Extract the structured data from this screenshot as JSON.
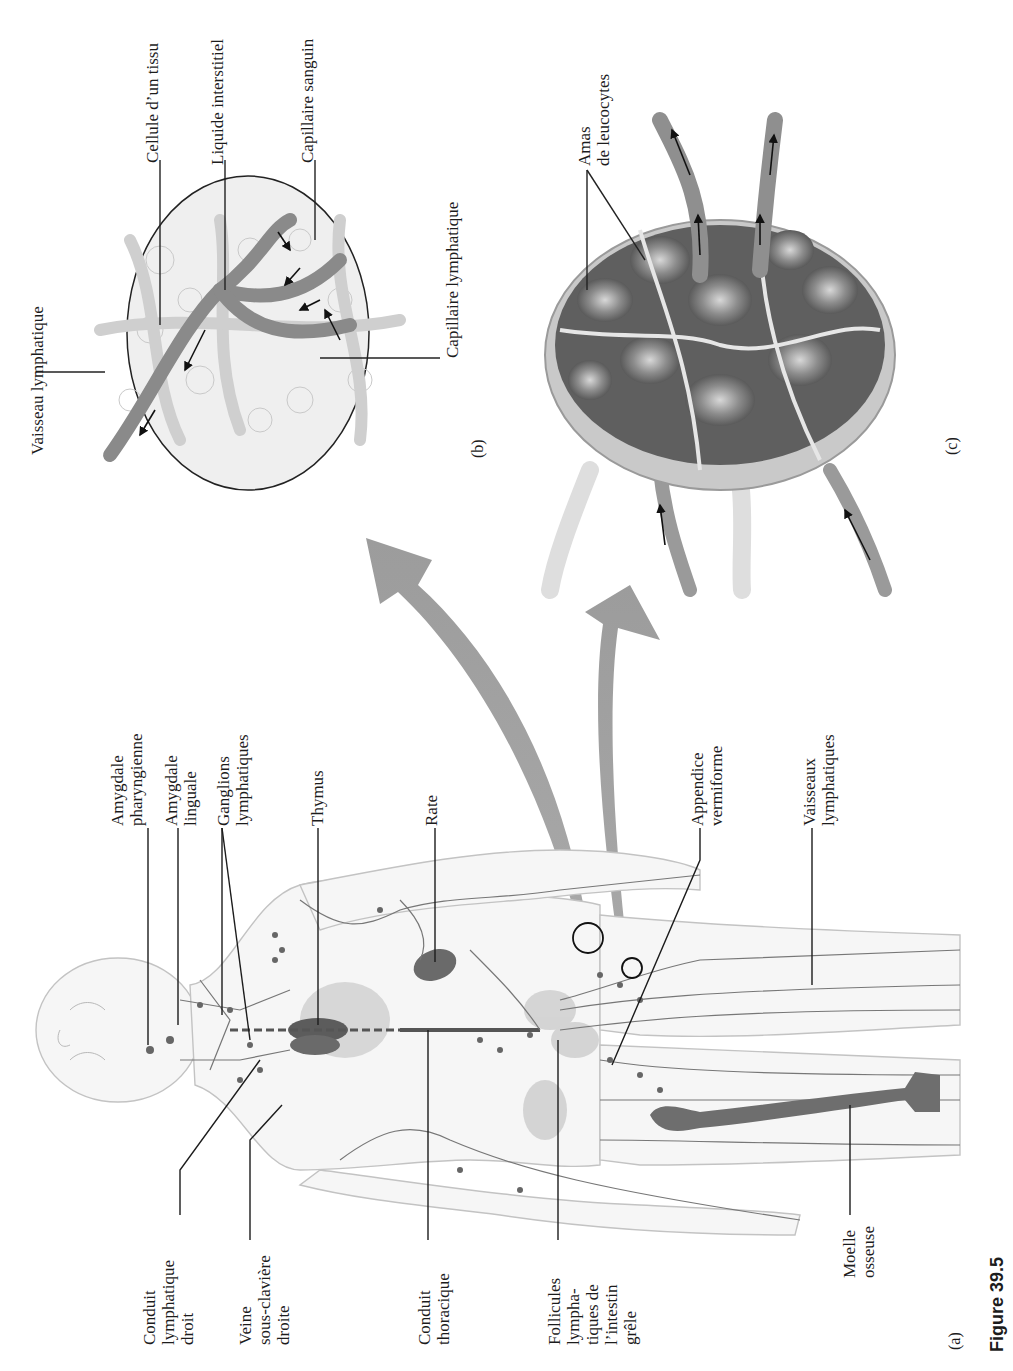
{
  "figure": {
    "caption": "Figure 39.5",
    "orientation": "rotated 90° counter-clockwise",
    "panels": {
      "a": "(a)",
      "b": "(b)",
      "c": "(c)"
    }
  },
  "panel_a_body": {
    "labels_top": [
      {
        "id": "amygdale-pharyngienne",
        "text": "Amygdale\npharyngienne"
      },
      {
        "id": "amygdale-linguale",
        "text": "Amygdale\nlinguale"
      },
      {
        "id": "ganglions-lymphatiques",
        "text": "Ganglions\nlymphatiques"
      },
      {
        "id": "thymus",
        "text": "Thymus"
      },
      {
        "id": "rate",
        "text": "Rate"
      },
      {
        "id": "appendice-vermiforme",
        "text": "Appendice\nvermiforme"
      },
      {
        "id": "vaisseaux-lymphatiques",
        "text": "Vaisseaux\nlymphatiques"
      }
    ],
    "labels_bottom": [
      {
        "id": "conduit-lymphatique-droit",
        "text": "Conduit\nlymphatique\ndroit"
      },
      {
        "id": "veine-sous-claviere-droite",
        "text": "Veine\nsous-clavière\ndroite"
      },
      {
        "id": "conduit-thoracique",
        "text": "Conduit\nthoracique"
      },
      {
        "id": "follicules-lymphatiques",
        "text": "Follicules\nlympha-\ntiques de\nl’intestin\ngrêle"
      },
      {
        "id": "moelle-osseuse",
        "text": "Moelle\nosseuse"
      }
    ]
  },
  "panel_b_capillaries": {
    "labels": [
      {
        "id": "vaisseau-lymphatique",
        "text": "Vaisseau lymphatique"
      },
      {
        "id": "cellule-tissu",
        "text": "Cellule d’un tissu"
      },
      {
        "id": "liquide-interstitiel",
        "text": "Liquide interstitiel"
      },
      {
        "id": "capillaire-sanguin",
        "text": "Capillaire sanguin"
      },
      {
        "id": "capillaire-lymphatique",
        "text": "Capillaire lymphatique"
      }
    ]
  },
  "panel_c_node": {
    "labels": [
      {
        "id": "amas-leucocytes",
        "text": "Amas\nde leucocytes"
      }
    ]
  },
  "colors": {
    "ink": "#1c1c1c",
    "big_arrow": "#9a9a9a",
    "vessel": "#6e6e6e",
    "organ_dark": "#5c5c5c",
    "tissue": "#e9e9e9",
    "outline": "#bdbdbd"
  }
}
